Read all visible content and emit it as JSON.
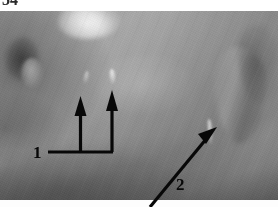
{
  "figure": {
    "number_label": "34",
    "type": "grayscale annotated photograph",
    "alt": "Grayscale close-up photograph of tissue surface with numbered arrow annotations"
  },
  "photo": {
    "name": "grayscale-tissue-photo",
    "background_color": "#8e8e8e",
    "highlight_color": "#ffffff",
    "shadow_color": "#1a1a1a"
  },
  "annotations": {
    "color": "#080808",
    "items": [
      {
        "label": "1",
        "name": "annotation-marker-1",
        "kind": "bracket-with-two-arrows",
        "label_x": 33,
        "label_y": 144,
        "bracket": {
          "line_y": 152,
          "line_x_start": 48,
          "line_x_end": 113,
          "arrows": [
            {
              "x": 80,
              "tip_y": 98,
              "base_y": 152
            },
            {
              "x": 112,
              "tip_y": 92,
              "base_y": 152
            }
          ]
        }
      },
      {
        "label": "2",
        "name": "annotation-marker-2",
        "kind": "diagonal-arrow",
        "label_x": 176,
        "label_y": 176,
        "arrow": {
          "tail_x": 170,
          "tail_y": 186,
          "tip_x": 218,
          "tip_y": 128
        }
      }
    ]
  }
}
